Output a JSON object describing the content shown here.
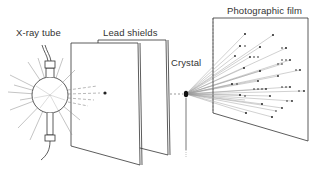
{
  "diagram": {
    "type": "x-ray-diffraction-setup",
    "labels": {
      "xray_tube": "X-ray tube",
      "lead_shields": "Lead shields",
      "crystal": "Crystal",
      "film": "Photographic film"
    },
    "components": [
      {
        "id": "xray_tube",
        "label": "X-ray tube",
        "icon": "glowing-bulb"
      },
      {
        "id": "lead_shields",
        "label": "Lead shields",
        "count": 2,
        "feature": "pinhole"
      },
      {
        "id": "crystal",
        "label": "Crystal"
      },
      {
        "id": "film",
        "label": "Photographic film",
        "feature": "diffraction-spots"
      }
    ],
    "colors": {
      "stroke": "#333333",
      "ray": "#888888",
      "background": "#ffffff"
    }
  }
}
